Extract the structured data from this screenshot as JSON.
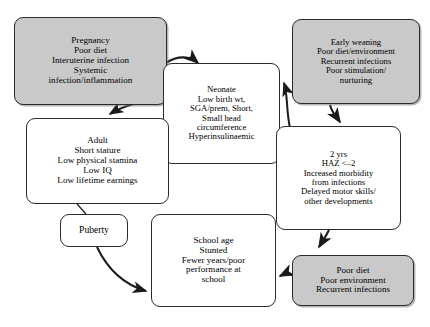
{
  "diagram": {
    "type": "cycle-flowchart",
    "colors": {
      "shaded_box_fill": "#c9c9c9",
      "plain_box_fill": "#ffffff",
      "stroke": "#2b2b2b",
      "background": "#ffffff"
    },
    "nodes": [
      {
        "id": "pregnancy",
        "shaded": true,
        "lines": [
          "Pregnancy",
          "Poor diet",
          "Interuterine infection",
          "Systemic",
          "infection/inflammation"
        ]
      },
      {
        "id": "neonate",
        "shaded": false,
        "lines": [
          "Neonate",
          "Low birth wt,",
          "SGA/prem, Short,",
          "Small head",
          "circumference",
          "Hyperinsulinaemic"
        ]
      },
      {
        "id": "early-weaning",
        "shaded": true,
        "lines": [
          "Early weaning",
          "Poor diet/environment",
          "Recurrent infections",
          "Poor stimulation/",
          "nurturing"
        ]
      },
      {
        "id": "two-years",
        "shaded": false,
        "lines": [
          "2 yrs",
          "HAZ <–2",
          "Increased morbidity",
          "from infections",
          "Delayed motor skills/",
          "other developments"
        ]
      },
      {
        "id": "poor-diet",
        "shaded": true,
        "lines": [
          "Poor diet",
          "Poor environment",
          "Recurrent infections"
        ]
      },
      {
        "id": "school-age",
        "shaded": false,
        "lines": [
          "School age",
          "Stunted",
          "Fewer years/poor",
          "performance at",
          "school"
        ]
      },
      {
        "id": "puberty",
        "shaded": false,
        "lines": [
          "Puberty"
        ]
      },
      {
        "id": "adult",
        "shaded": false,
        "lines": [
          "Adult",
          "Short stature",
          "Low physical stamina",
          "Low IQ",
          "Low lifetime earnings"
        ]
      }
    ],
    "edges": [
      {
        "from": "pregnancy",
        "to": "neonate",
        "style": "curved-arrow"
      },
      {
        "from": "neonate",
        "to": "pregnancy",
        "style": "curved-arrow"
      },
      {
        "from": "neonate",
        "to": "adult",
        "style": "curved-arrow"
      },
      {
        "from": "two-years",
        "to": "neonate",
        "style": "curved-arrow"
      },
      {
        "from": "early-weaning",
        "to": "two-years",
        "style": "curved-arrow"
      },
      {
        "from": "two-years",
        "to": "school-age",
        "style": "curved-arrow"
      },
      {
        "from": "poor-diet",
        "to": "school-age",
        "style": "curved-arrow"
      },
      {
        "from": "school-age",
        "to": "puberty",
        "style": "curved-arrow"
      },
      {
        "from": "puberty",
        "to": "adult",
        "style": "plain-line"
      }
    ]
  }
}
